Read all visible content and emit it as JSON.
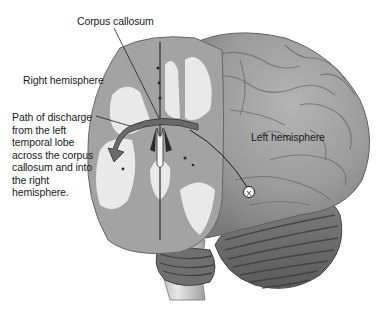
{
  "figure": {
    "labels": {
      "corpus_callosum": "Corpus callosum",
      "right_hemisphere": "Right hemisphere",
      "left_hemisphere": "Left hemisphere",
      "path_of_discharge": "Path of discharge\nfrom the left\ntemporal lobe\nacross the corpus\ncallosum and into\nthe right\nhemisphere."
    },
    "markers": [
      {
        "name": "seizure-focus",
        "glyph": "X",
        "x": 249,
        "y": 192
      }
    ],
    "arrow": {
      "from": "left temporal lobe",
      "to": "right hemisphere",
      "via": "corpus callosum"
    },
    "caption_partial": ""
  },
  "colors": {
    "background": "#ffffff",
    "gray_matter": "#9a9a9a",
    "cortex_surface": "#8f8f8f",
    "white_matter": "#e6e6e6",
    "cerebellum": "#6e6e6e",
    "brainstem": "#c8c8c8",
    "arrow_fill": "#6a6a6a",
    "text": "#1a1a1a"
  }
}
